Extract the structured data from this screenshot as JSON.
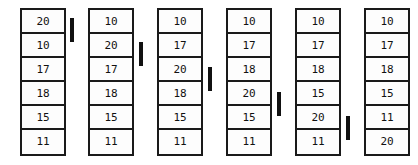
{
  "diagram": {
    "type": "sorting-trace",
    "cell_count_per_column": 6,
    "column_count": 6,
    "marker_count": 5,
    "colors": {
      "border": "#1a1a1a",
      "text": "#111111",
      "marker": "#111111",
      "background": "#ffffff"
    },
    "columns": [
      {
        "name": "step-1",
        "left": 20,
        "values": [
          "20",
          "10",
          "17",
          "18",
          "15",
          "11"
        ]
      },
      {
        "name": "step-2",
        "left": 88,
        "values": [
          "10",
          "20",
          "17",
          "18",
          "15",
          "11"
        ]
      },
      {
        "name": "step-3",
        "left": 157,
        "values": [
          "10",
          "17",
          "20",
          "18",
          "15",
          "11"
        ]
      },
      {
        "name": "step-4",
        "left": 226,
        "values": [
          "10",
          "17",
          "18",
          "20",
          "15",
          "11"
        ]
      },
      {
        "name": "step-5",
        "left": 295,
        "values": [
          "10",
          "17",
          "18",
          "15",
          "20",
          "11"
        ]
      },
      {
        "name": "step-6",
        "left": 364,
        "values": [
          "10",
          "17",
          "18",
          "15",
          "11",
          "20"
        ]
      }
    ],
    "markers": [
      {
        "name": "marker-1",
        "left": 70,
        "top": 18,
        "height": 24
      },
      {
        "name": "marker-2",
        "left": 139,
        "top": 42,
        "height": 24
      },
      {
        "name": "marker-3",
        "left": 208,
        "top": 67,
        "height": 24
      },
      {
        "name": "marker-4",
        "left": 277,
        "top": 92,
        "height": 24
      },
      {
        "name": "marker-5",
        "left": 346,
        "top": 116,
        "height": 24
      }
    ]
  }
}
